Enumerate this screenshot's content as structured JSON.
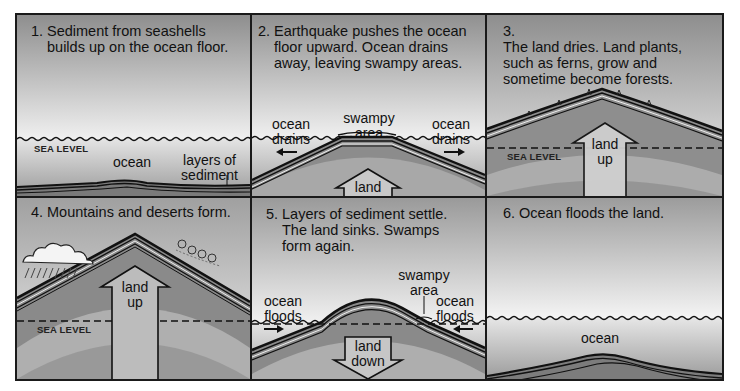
{
  "figure": {
    "colors": {
      "border": "#1a1a1a",
      "sky_top": "#8e8e8e",
      "sky_bottom": "#f2f2f2",
      "ocean": "#a8a8a8",
      "rock": "#8a8a8a",
      "rock_band": "#b8b8b8",
      "strata_line": "#1e1e1e"
    },
    "panels": [
      {
        "id": 1,
        "number": "1.",
        "caption": "Sediment from seashells builds up on the ocean floor.",
        "labels": {
          "sea_level": "SEA LEVEL",
          "ocean": "ocean",
          "sediment": "layers of sediment"
        }
      },
      {
        "id": 2,
        "number": "2.",
        "caption": "Earthquake pushes the ocean floor upward. Ocean drains away, leaving swampy areas.",
        "labels": {
          "left": "ocean drains",
          "center": "swampy area",
          "right": "ocean drains",
          "arrow": "land up"
        }
      },
      {
        "id": 3,
        "number": "3.",
        "caption": "The land dries. Land plants, such as ferns, grow and sometime become forests.",
        "labels": {
          "sea_level": "SEA LEVEL",
          "arrow": "land up"
        }
      },
      {
        "id": 4,
        "number": "4.",
        "caption": "Mountains and deserts form.",
        "labels": {
          "sea_level": "SEA LEVEL",
          "arrow": "land up"
        },
        "icons": [
          "rain-cloud-icon",
          "wind-swirl-icon"
        ]
      },
      {
        "id": 5,
        "number": "5.",
        "caption": "Layers of sediment settle. The land sinks. Swamps form again.",
        "labels": {
          "left": "ocean floods",
          "swamp": "swampy area",
          "right": "ocean floods",
          "arrow": "land down"
        }
      },
      {
        "id": 6,
        "number": "6.",
        "caption": "Ocean floods the land.",
        "labels": {
          "ocean": "ocean"
        }
      }
    ]
  }
}
